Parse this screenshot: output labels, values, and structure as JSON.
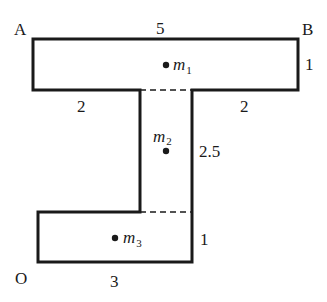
{
  "diagram": {
    "type": "composite-shape-center-of-mass",
    "stroke_color": "#1a1a1a",
    "corner_labels": {
      "top_left": "A",
      "top_right": "B",
      "origin": "O"
    },
    "dimensions": {
      "top_width": "5",
      "top_height": "1",
      "left_overhang": "2",
      "right_overhang": "2",
      "stem_height": "2.5",
      "bottom_height": "1",
      "bottom_width": "3"
    },
    "masses": [
      {
        "name": "m",
        "sub": "1"
      },
      {
        "name": "m",
        "sub": "2"
      },
      {
        "name": "m",
        "sub": "3"
      }
    ]
  }
}
